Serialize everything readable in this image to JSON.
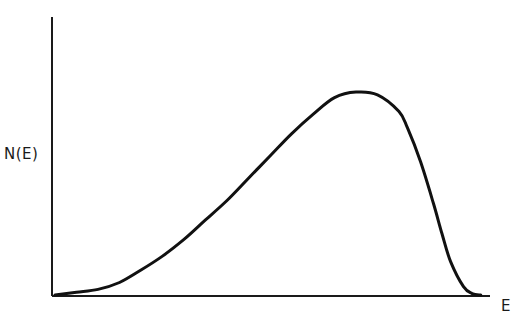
{
  "chart_data": {
    "type": "line",
    "title": "",
    "xlabel": "E",
    "ylabel": "N(E)",
    "grid": false,
    "legend": null,
    "xlim": [
      0,
      1
    ],
    "ylim": [
      0,
      1
    ],
    "x": [
      0.0,
      0.05,
      0.1,
      0.15,
      0.2,
      0.25,
      0.3,
      0.35,
      0.4,
      0.45,
      0.5,
      0.55,
      0.6,
      0.65,
      0.7,
      0.75,
      0.8,
      0.82,
      0.85,
      0.88,
      0.9,
      0.92,
      0.95,
      0.97,
      0.99
    ],
    "values": [
      0.0,
      0.01,
      0.02,
      0.045,
      0.09,
      0.14,
      0.2,
      0.27,
      0.34,
      0.42,
      0.5,
      0.58,
      0.65,
      0.71,
      0.73,
      0.72,
      0.66,
      0.6,
      0.48,
      0.33,
      0.22,
      0.12,
      0.03,
      0.005,
      0.0
    ]
  },
  "labels": {
    "y": "N(E)",
    "x": "E"
  },
  "colors": {
    "line": "#111111",
    "background": "#ffffff"
  }
}
